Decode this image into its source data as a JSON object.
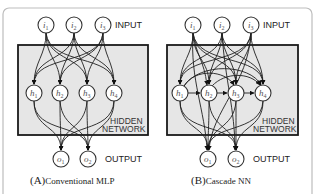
{
  "panels": [
    {
      "id": "A",
      "caption_letter": "(A)",
      "caption_text": "Conventional MLP",
      "labels": {
        "input": "INPUT",
        "hidden_1": "HIDDEN",
        "hidden_2": "NETWORK",
        "output": "OUTPUT"
      },
      "input_nodes": [
        {
          "base": "i",
          "sub": "1"
        },
        {
          "base": "i",
          "sub": "2"
        },
        {
          "base": "i",
          "sub": "3"
        }
      ],
      "hidden_nodes": [
        {
          "base": "h",
          "sub": "1"
        },
        {
          "base": "h",
          "sub": "2"
        },
        {
          "base": "h",
          "sub": "3"
        },
        {
          "base": "h",
          "sub": "4"
        }
      ],
      "output_nodes": [
        {
          "base": "o",
          "sub": "1"
        },
        {
          "base": "o",
          "sub": "2"
        }
      ],
      "connections": "input→hidden (all), hidden→output (all)"
    },
    {
      "id": "B",
      "caption_letter": "(B)",
      "caption_text": "Cascade NN",
      "labels": {
        "input": "INPUT",
        "hidden_1": "HIDDEN",
        "hidden_2": "NETWORK",
        "output": "OUTPUT"
      },
      "input_nodes": [
        {
          "base": "i",
          "sub": "1"
        },
        {
          "base": "i",
          "sub": "2"
        },
        {
          "base": "i",
          "sub": "3"
        }
      ],
      "hidden_nodes": [
        {
          "base": "h",
          "sub": "1"
        },
        {
          "base": "h",
          "sub": "2"
        },
        {
          "base": "h",
          "sub": "3"
        },
        {
          "base": "h",
          "sub": "4"
        }
      ],
      "output_nodes": [
        {
          "base": "o",
          "sub": "1"
        },
        {
          "base": "o",
          "sub": "2"
        }
      ],
      "connections": "input→hidden (all), hidden→later hidden (cascade), input→output, hidden→output"
    }
  ]
}
